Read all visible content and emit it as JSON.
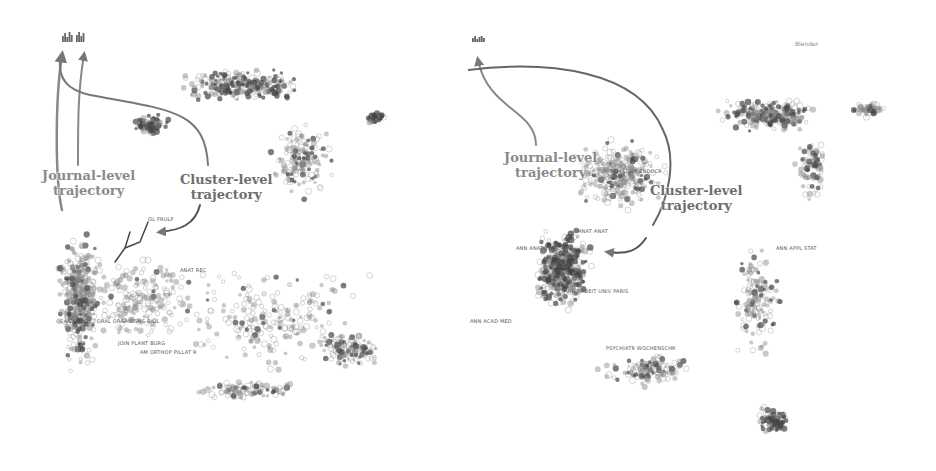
{
  "colors": {
    "dot": "#6a6a6a",
    "dot_dark": "#3a3a3a",
    "arrow": "#7a7a7a",
    "text": "#8a8a8a"
  },
  "panels": [
    {
      "id": "left",
      "journal_label": "Journal-level\ntrajectory",
      "cluster_label": "Cluster-level\ntrajectory",
      "map_labels": [
        "OL FRULP",
        "ANAT REC",
        "CAN J ZOOL / ORAL ORGANISMS BIOL",
        "JOIN PLANT BURG",
        "AM ORTHOP PILLAT R"
      ],
      "corner_label": ""
    },
    {
      "id": "right",
      "journal_label": "Journal-level\ntrajectory",
      "cluster_label": "Cluster-level\ntrajectory",
      "map_labels": [
        "SEM LUMP ENDOCR",
        "ANAT ANAT",
        "ANN ANATOMY CAR",
        "ANN ARBEIT UNIV PARIS",
        "ANN ACAD MED",
        "PSYCHIATR WOCHENSCHR",
        "ANN APPL STAT"
      ],
      "corner_label": "Blender"
    }
  ]
}
